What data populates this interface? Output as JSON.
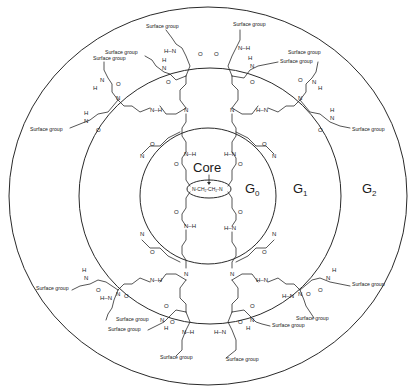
{
  "diagram": {
    "core": {
      "label": "Core",
      "formula": "N-CH₂-CH₂-N"
    },
    "generations": [
      {
        "label": "G",
        "sub": "0"
      },
      {
        "label": "G",
        "sub": "1"
      },
      {
        "label": "G",
        "sub": "2"
      }
    ],
    "surface_group_label": "Surface group",
    "atoms": {
      "nitrogen": "N",
      "hydrogen": "H",
      "oxygen": "O",
      "nh": "N–H",
      "hn": "H–N"
    },
    "surface_groups": [
      {
        "x": 146,
        "y": 28
      },
      {
        "x": 105,
        "y": 54
      },
      {
        "x": 93,
        "y": 60
      },
      {
        "x": 30,
        "y": 131
      },
      {
        "x": 233,
        "y": 26
      },
      {
        "x": 288,
        "y": 54
      },
      {
        "x": 280,
        "y": 63
      },
      {
        "x": 352,
        "y": 131
      },
      {
        "x": 36,
        "y": 290
      },
      {
        "x": 116,
        "y": 321
      },
      {
        "x": 108,
        "y": 331
      },
      {
        "x": 160,
        "y": 359
      },
      {
        "x": 352,
        "y": 286
      },
      {
        "x": 296,
        "y": 320
      },
      {
        "x": 272,
        "y": 327
      },
      {
        "x": 226,
        "y": 361
      }
    ],
    "rings": {
      "center": {
        "x": 208,
        "y": 196
      },
      "outer": {
        "rx": 199,
        "ry": 189
      },
      "middle": {
        "rx": 131,
        "ry": 128
      },
      "inner": {
        "rx": 68,
        "ry": 68
      }
    }
  }
}
